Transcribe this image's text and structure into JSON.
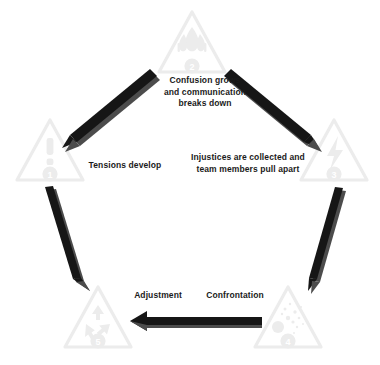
{
  "diagram": {
    "type": "cycle-pentagon",
    "colors": {
      "triangle_stroke": "#e9e9e9",
      "triangle_icon": "#ededed",
      "badge_fill": "#ededed",
      "badge_text": "#ffffff",
      "arrow_fill": "#1a1a1a",
      "arrow_side": "#4a4a4a",
      "label_text": "#1b1b1b",
      "background": "#ffffff"
    },
    "nodes": [
      {
        "id": "node-1",
        "number": "1",
        "icon": "exclamation-warning-icon",
        "position": "left",
        "cx": 50,
        "cy": 155
      },
      {
        "id": "node-2",
        "number": "2",
        "icon": "flame-icon",
        "position": "top",
        "cx": 192,
        "cy": 47
      },
      {
        "id": "node-3",
        "number": "3",
        "icon": "lightning-bolt-icon",
        "position": "right",
        "cx": 334,
        "cy": 155
      },
      {
        "id": "node-4",
        "number": "4",
        "icon": "explosion-burst-icon",
        "position": "bottom-right",
        "cx": 288,
        "cy": 322
      },
      {
        "id": "node-5",
        "number": "5",
        "icon": "recycle-arrows-icon",
        "position": "bottom-left",
        "cx": 98,
        "cy": 322
      }
    ],
    "edges": [
      {
        "id": "edge-2-to-1",
        "from": "node-2",
        "to": "node-1",
        "label": "Tensions develop",
        "direction": "down-left"
      },
      {
        "id": "edge-2-to-3",
        "from": "node-2",
        "to": "node-3",
        "label": "Injustices are collected and\nteam members pull apart",
        "direction": "down-right"
      },
      {
        "id": "edge-3-to-4",
        "from": "node-3",
        "to": "node-4",
        "label": "Confrontation",
        "direction": "down"
      },
      {
        "id": "edge-4-to-5",
        "from": "node-4",
        "to": "node-5",
        "label": "Adjustment",
        "direction": "left"
      },
      {
        "id": "edge-1-to-5",
        "from": "node-1",
        "to": "node-5",
        "label": "",
        "direction": "down"
      }
    ],
    "labels": {
      "tensions": "Tensions develop",
      "confusion": "Confusion grows\nand communication\nbreaks down",
      "injustices": "Injustices are collected and\nteam members pull apart",
      "confrontation": "Confrontation",
      "adjustment": "Adjustment"
    }
  }
}
